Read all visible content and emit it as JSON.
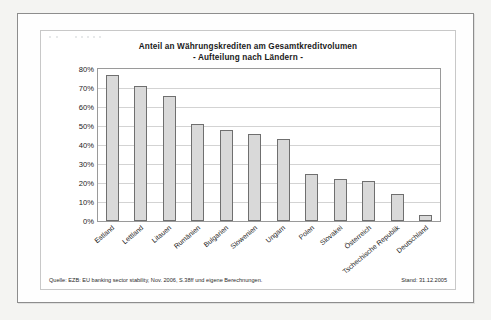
{
  "chart_data": {
    "type": "bar",
    "title": "Anteil an Währungskrediten am Gesamtkreditvolumen",
    "subtitle": "- Aufteilung nach Ländern -",
    "xlabel": "",
    "ylabel": "",
    "ylim": [
      0,
      80
    ],
    "ytick_labels": [
      "80%",
      "70%",
      "60%",
      "50%",
      "40%",
      "30%",
      "20%",
      "10%",
      "0%"
    ],
    "ytick_values": [
      80,
      70,
      60,
      50,
      40,
      30,
      20,
      10,
      0
    ],
    "grid": true,
    "legend": "none",
    "categories": [
      "Estland",
      "Lettland",
      "Litauen",
      "Rumänien",
      "Bulgarien",
      "Slowenien",
      "Ungarn",
      "Polen",
      "Slovakei",
      "Österreich",
      "Tschechische Republik",
      "Deutschland"
    ],
    "values": [
      77,
      71,
      66,
      51,
      48,
      46,
      43,
      25,
      22,
      21,
      14,
      3
    ],
    "bar_fill_color": "#d9d9d9",
    "bar_border_color": "#6f6f6f",
    "gridline_color": "#d3d3d3"
  },
  "footer": {
    "source": "Quelle: EZB: EU banking sector stability, Nov. 2006, S.38ff und eigene Berechnungen.",
    "date": "Stand: 31.12.2005"
  }
}
